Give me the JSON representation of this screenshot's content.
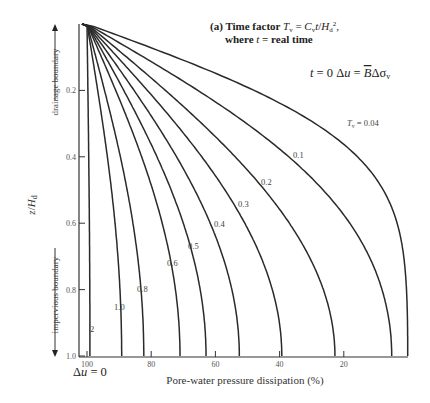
{
  "chart_data": {
    "type": "line",
    "title_lines": [
      "(a) Time factor ",
      "where ",
      " = real time"
    ],
    "initial_condition": "t = 0   Δu = B̄Δσ_v",
    "xlabel": "Pore-water pressure dissipation (%)",
    "ylabel": "z/H_d",
    "x_ticks": [
      "100",
      "80",
      "60",
      "40",
      "20"
    ],
    "x_tick_values": [
      100,
      80,
      60,
      40,
      20
    ],
    "y_ticks": [
      "0.2",
      "0.4",
      "0.6",
      "0.8",
      "1.0"
    ],
    "y_tick_values": [
      0.2,
      0.4,
      0.6,
      0.8,
      1.0
    ],
    "xlim": [
      100,
      0
    ],
    "ylim": [
      0,
      1.0
    ],
    "x_origin_label": "Δu = 0",
    "top_boundary_label": "drainage boundary",
    "bottom_boundary_label": "impervious boundary",
    "series": [
      {
        "name": "Tv = 0.04",
        "Tv": 0.04,
        "label": "Tv = 0.04",
        "label_pos": [
          347,
          126
        ]
      },
      {
        "name": "Tv = 0.1",
        "Tv": 0.1,
        "label": "0.1",
        "label_pos": [
          293,
          158
        ]
      },
      {
        "name": "Tv = 0.2",
        "Tv": 0.2,
        "label": "0.2",
        "label_pos": [
          261,
          185
        ]
      },
      {
        "name": "Tv = 0.3",
        "Tv": 0.3,
        "label": "0.3",
        "label_pos": [
          238,
          207
        ]
      },
      {
        "name": "Tv = 0.4",
        "Tv": 0.4,
        "label": "0.4",
        "label_pos": [
          214,
          227
        ]
      },
      {
        "name": "Tv = 0.5",
        "Tv": 0.5,
        "label": "0.5",
        "label_pos": [
          188,
          249
        ]
      },
      {
        "name": "Tv = 0.6",
        "Tv": 0.6,
        "label": "0.6",
        "label_pos": [
          167,
          266
        ]
      },
      {
        "name": "Tv = 0.8",
        "Tv": 0.8,
        "label": "0.8",
        "label_pos": [
          137,
          292
        ]
      },
      {
        "name": "Tv = 1.0",
        "Tv": 1.0,
        "label": "1.0",
        "label_pos": [
          114,
          310
        ]
      },
      {
        "name": "Tv = 2",
        "Tv": 2.0,
        "label": "2",
        "label_pos": [
          90,
          332
        ]
      }
    ],
    "grid": false,
    "legend": "inline curve labels"
  }
}
